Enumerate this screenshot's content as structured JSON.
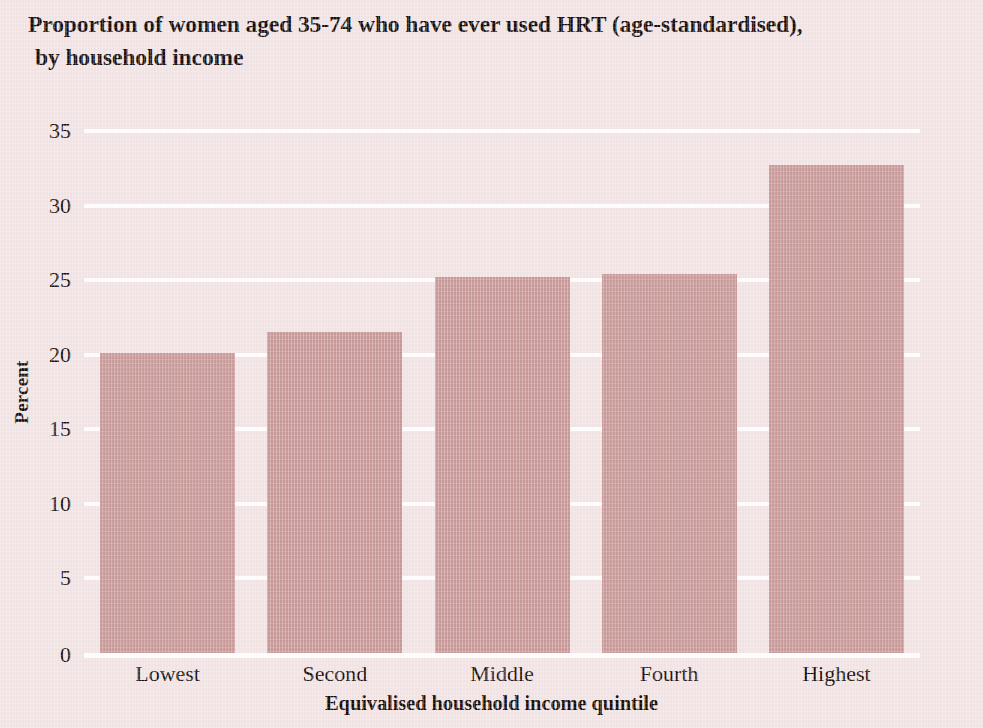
{
  "chart_data": {
    "type": "bar",
    "title": "Proportion of women aged 35-74 who have ever used HRT (age-standardised), by household income",
    "title_line1": "Proportion of women aged 35-74 who have ever used HRT (age-standardised),",
    "title_line2": "by household income",
    "categories": [
      "Lowest",
      "Second",
      "Middle",
      "Fourth",
      "Highest"
    ],
    "values": [
      20.1,
      21.5,
      25.2,
      25.4,
      32.7
    ],
    "xlabel": "Equivalised household income quintile",
    "ylabel": "Percent",
    "ylim": [
      0,
      35
    ],
    "ytick_values": [
      0,
      5,
      10,
      15,
      20,
      25,
      30,
      35
    ],
    "ytick_labels": [
      "0",
      "5",
      "10",
      "15",
      "20",
      "25",
      "30",
      "35"
    ],
    "grid": true,
    "grid_color": "#fdfbfb",
    "legend": null,
    "bar_color": "#c99a9a",
    "background_color": "#f1e3e3"
  }
}
